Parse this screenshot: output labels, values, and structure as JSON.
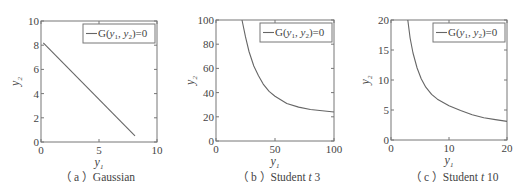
{
  "figure": {
    "legend_label": "G(y₁, y₂)=0",
    "xlabel": "y₁",
    "ylabel": "y₂",
    "line_color": "#666666",
    "axis_color": "#777777"
  },
  "chart_data": [
    {
      "type": "line",
      "panel": "a",
      "caption": "（ a ）Gaussian",
      "caption_prefix": "（ a ）",
      "caption_name": "Gaussian",
      "caption_param": "",
      "xlabel": "y1",
      "ylabel": "y2",
      "xlim": [
        0,
        10
      ],
      "ylim": [
        0,
        10
      ],
      "xticks": [
        0,
        5,
        10
      ],
      "yticks": [
        0,
        2,
        4,
        6,
        8,
        10
      ],
      "grid": false,
      "legend_position": "upper right",
      "series": [
        {
          "name": "G(y1, y2)=0",
          "x": [
            0.2,
            8.1
          ],
          "y": [
            8.2,
            0.5
          ]
        }
      ]
    },
    {
      "type": "line",
      "panel": "b",
      "caption": "（ b ）Student t 3",
      "caption_prefix": "（ b ）",
      "caption_name": "Student ",
      "caption_param": "t",
      "caption_suffix": " 3",
      "xlabel": "y1",
      "ylabel": "y2",
      "xlim": [
        0,
        100
      ],
      "ylim": [
        0,
        100
      ],
      "xticks": [
        0,
        50,
        100
      ],
      "yticks": [
        0,
        20,
        40,
        60,
        80,
        100
      ],
      "grid": false,
      "legend_position": "upper right",
      "series": [
        {
          "name": "G(y1, y2)=0",
          "x": [
            22,
            25,
            28,
            32,
            36,
            40,
            45,
            50,
            60,
            70,
            80,
            90,
            100
          ],
          "y": [
            100,
            86,
            74,
            62,
            54,
            47,
            41,
            37,
            31,
            28,
            26,
            25,
            24
          ]
        }
      ]
    },
    {
      "type": "line",
      "panel": "c",
      "caption": "（ c ）Student t 10",
      "caption_prefix": "（ c ）",
      "caption_name": "Student ",
      "caption_param": "t",
      "caption_suffix": " 10",
      "xlabel": "y1",
      "ylabel": "y2",
      "xlim": [
        0,
        20
      ],
      "ylim": [
        0,
        20
      ],
      "xticks": [
        0,
        10,
        20
      ],
      "yticks": [
        0,
        5,
        10,
        15,
        20
      ],
      "grid": false,
      "legend_position": "upper right",
      "series": [
        {
          "name": "G(y1, y2)=0",
          "x": [
            2.9,
            3.3,
            3.8,
            4.5,
            5.2,
            6,
            7,
            8,
            10,
            12,
            14,
            16,
            18,
            20
          ],
          "y": [
            20,
            17,
            14.5,
            12,
            10.2,
            8.8,
            7.6,
            6.8,
            5.7,
            4.9,
            4.2,
            3.7,
            3.4,
            3.1
          ]
        }
      ]
    }
  ]
}
